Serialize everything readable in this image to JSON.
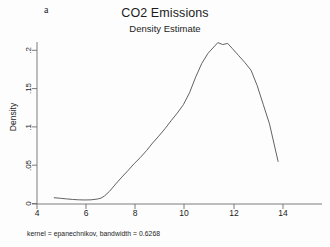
{
  "figure": {
    "panel_letter": "a",
    "title": "CO2 Emissions",
    "subtitle": "Density Estimate",
    "footnote": "kernel = epanechnikov, bandwidth = 0.6268",
    "background_color": "#fdfdfd",
    "line_color": "#5a5a5a",
    "axis_color": "#6e6e6e"
  },
  "axes": {
    "ylabel": "Density",
    "xlabel": "",
    "y_ticks": [
      {
        "value": 0,
        "label": "0"
      },
      {
        "value": 0.05,
        "label": ".05"
      },
      {
        "value": 0.1,
        "label": ".1"
      },
      {
        "value": 0.15,
        "label": ".15"
      },
      {
        "value": 0.2,
        "label": ".2"
      }
    ],
    "x_ticks": [
      {
        "value": 4,
        "label": "4"
      },
      {
        "value": 6,
        "label": "6"
      },
      {
        "value": 8,
        "label": "8"
      },
      {
        "value": 10,
        "label": "10"
      },
      {
        "value": 12,
        "label": "12"
      },
      {
        "value": 14,
        "label": "14"
      }
    ]
  },
  "chart_data": {
    "type": "line",
    "title": "CO2 Emissions",
    "subtitle": "Density Estimate",
    "xlabel": "",
    "ylabel": "Density",
    "xlim": [
      3.6,
      15.0
    ],
    "ylim": [
      0,
      0.225
    ],
    "grid": false,
    "legend": null,
    "annotations": [
      "a",
      "kernel = epanechnikov, bandwidth = 0.6268"
    ],
    "series": [
      {
        "name": "Kernel density estimate",
        "color": "#5a5a5a",
        "x": [
          4.7,
          4.95,
          5.2,
          5.45,
          5.7,
          5.95,
          6.2,
          6.45,
          6.6,
          6.75,
          6.95,
          7.2,
          7.45,
          7.7,
          7.95,
          8.2,
          8.45,
          8.7,
          8.95,
          9.2,
          9.45,
          9.7,
          9.95,
          10.2,
          10.45,
          10.7,
          10.95,
          11.15,
          11.35,
          11.55,
          11.75,
          11.95,
          12.2,
          12.45,
          12.7,
          12.95,
          13.2,
          13.45,
          13.8
        ],
        "y": [
          0.0075,
          0.0068,
          0.006,
          0.0053,
          0.0048,
          0.0046,
          0.0048,
          0.0058,
          0.007,
          0.01,
          0.016,
          0.0255,
          0.0345,
          0.043,
          0.052,
          0.06,
          0.069,
          0.079,
          0.088,
          0.0975,
          0.108,
          0.118,
          0.129,
          0.1445,
          0.165,
          0.183,
          0.196,
          0.203,
          0.21,
          0.2075,
          0.209,
          0.202,
          0.193,
          0.184,
          0.174,
          0.154,
          0.129,
          0.104,
          0.055
        ]
      }
    ]
  }
}
